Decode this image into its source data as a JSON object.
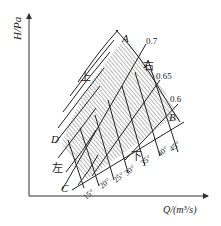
{
  "figure": {
    "type": "fan characteristic diagram (blade angle adjustment zone)",
    "y_axis_label": "H/Pa",
    "x_axis_label": "Q/(m³/s)",
    "corner_labels": {
      "A": "A",
      "B": "B",
      "C": "C",
      "D": "D"
    },
    "direction_labels": {
      "up": "上",
      "right": "右",
      "down": "下",
      "left": "左"
    },
    "efficiency_lines": [
      "0.7",
      "0.65",
      "0.6"
    ],
    "blade_angles": [
      "15°",
      "20°",
      "25°",
      "30°",
      "35°",
      "40°",
      "45°"
    ]
  }
}
